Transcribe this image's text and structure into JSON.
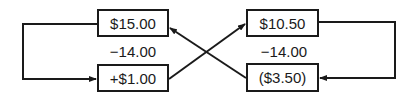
{
  "left": {
    "top_box": "$15.00",
    "operator": "−14.00",
    "bottom_box": "+$1.00"
  },
  "right": {
    "top_box": "$10.50",
    "operator": "−14.00",
    "bottom_box": "($3.50)"
  },
  "colors": {
    "line": "#1a1a1a",
    "background": "#ffffff"
  }
}
